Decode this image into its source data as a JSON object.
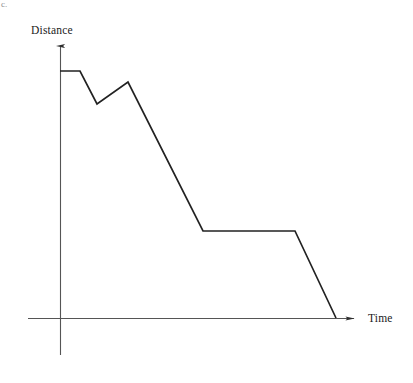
{
  "figure": {
    "corner_mark": "c.",
    "background_color": "#ffffff",
    "line_color": "#222222",
    "axis_color": "#555555",
    "width": 413,
    "height": 383
  },
  "labels": {
    "y_axis": "Distance",
    "x_axis": "Time"
  },
  "chart_data": {
    "type": "line",
    "title": "",
    "xlabel": "Time",
    "ylabel": "Distance",
    "grid": false,
    "legend": false,
    "axis_arrows": true,
    "tick_labels_x": [],
    "tick_labels_y": [],
    "xlim": [
      0,
      10
    ],
    "ylim": [
      0,
      10
    ],
    "series": [
      {
        "name": "Distance",
        "color": "#222222",
        "x": [
          0.0,
          0.72,
          1.34,
          2.46,
          5.17,
          8.49,
          9.97
        ],
        "y": [
          8.92,
          8.92,
          7.72,
          8.52,
          3.13,
          3.13,
          0.0
        ],
        "pixel_points": [
          {
            "x": 60,
            "y": 71
          },
          {
            "x": 80,
            "y": 71
          },
          {
            "x": 97,
            "y": 104
          },
          {
            "x": 128,
            "y": 82
          },
          {
            "x": 203,
            "y": 231
          },
          {
            "x": 295,
            "y": 231
          },
          {
            "x": 336,
            "y": 318
          }
        ],
        "segments": [
          {
            "label": "flat-start",
            "description": "constant distance"
          },
          {
            "label": "decline-1",
            "description": "distance decreases"
          },
          {
            "label": "rise-1",
            "description": "distance increases"
          },
          {
            "label": "steep-decline",
            "description": "distance decreases steadily"
          },
          {
            "label": "flat-middle",
            "description": "constant distance"
          },
          {
            "label": "final-decline",
            "description": "distance returns to zero"
          }
        ]
      }
    ],
    "axes_pixel_geometry": {
      "origin": {
        "x": 60,
        "y": 318
      },
      "x_axis": {
        "x_start": 28,
        "x_end": 360,
        "y": 318
      },
      "y_axis": {
        "x": 60,
        "y_top": 40,
        "y_bottom": 355
      }
    }
  }
}
